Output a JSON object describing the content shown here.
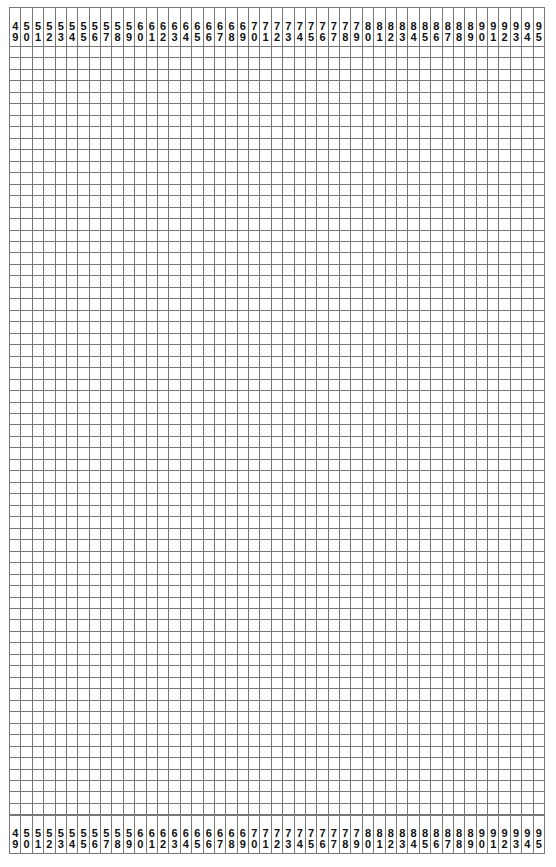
{
  "grid": {
    "column_labels": [
      "49",
      "50",
      "51",
      "52",
      "53",
      "54",
      "55",
      "56",
      "57",
      "58",
      "59",
      "60",
      "61",
      "62",
      "63",
      "64",
      "65",
      "66",
      "67",
      "68",
      "69",
      "70",
      "71",
      "72",
      "73",
      "74",
      "75",
      "76",
      "77",
      "78",
      "79",
      "80",
      "81",
      "82",
      "83",
      "84",
      "85",
      "86",
      "87",
      "88",
      "89",
      "90",
      "91",
      "92",
      "93",
      "94",
      "95"
    ],
    "row_count": 67,
    "line_color": "#777777"
  }
}
